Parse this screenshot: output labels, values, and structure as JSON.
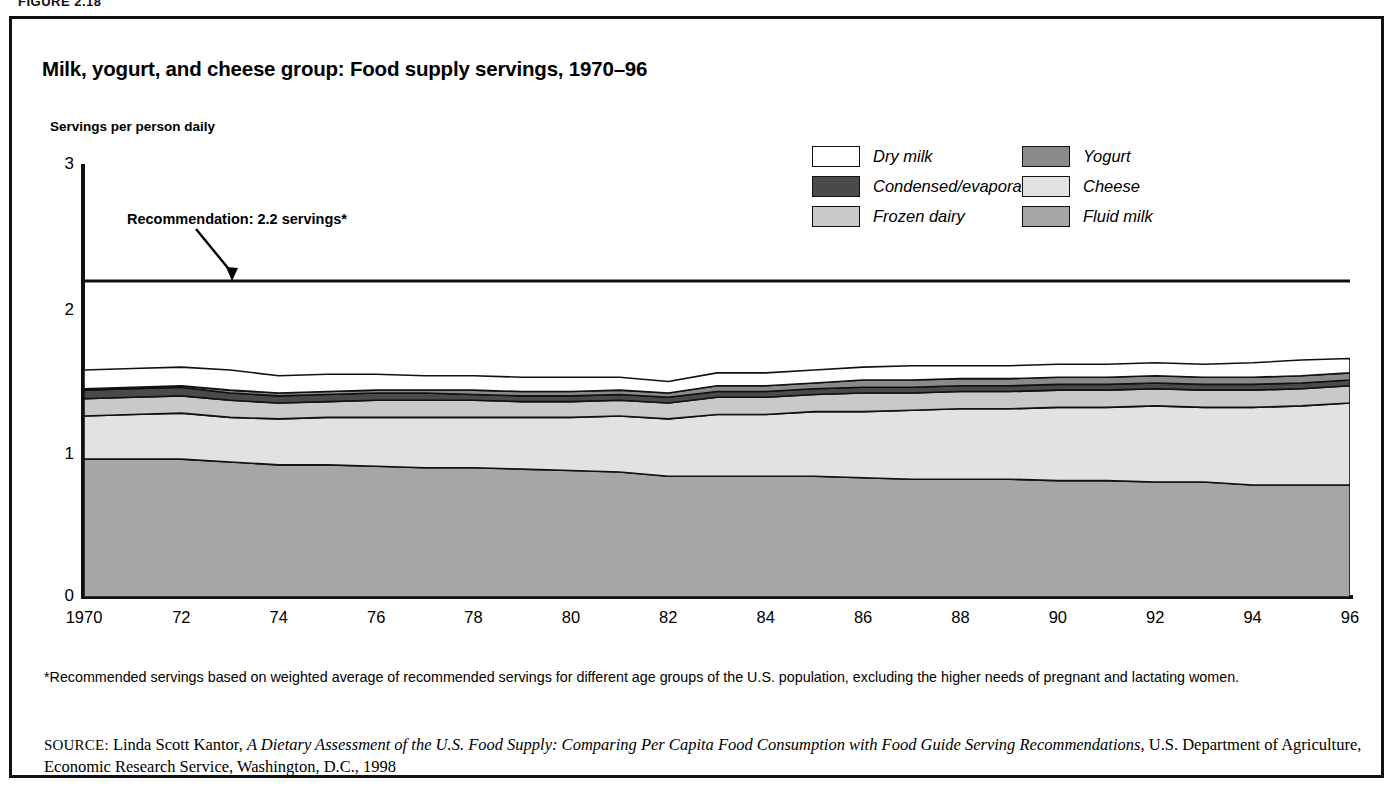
{
  "figure": {
    "label": "FIGURE 2.18"
  },
  "chart_title": "Milk, yogurt, and cheese group: Food supply servings, 1970–96",
  "y_axis_title": "Servings per person daily",
  "annotation": {
    "text": "Recommendation: 2.2 servings*",
    "value": 2.2
  },
  "legend": {
    "rows": [
      [
        {
          "label": "Dry milk",
          "color": "#ffffff"
        },
        {
          "label": "Yogurt",
          "color": "#8a8a8a"
        }
      ],
      [
        {
          "label": "Condensed/evaporated",
          "color": "#4a4a4a"
        },
        {
          "label": "Cheese",
          "color": "#e2e2e2"
        }
      ],
      [
        {
          "label": "Frozen dairy",
          "color": "#c9c9c9"
        },
        {
          "label": "Fluid milk",
          "color": "#a6a6a6"
        }
      ]
    ]
  },
  "footnote": "*Recommended servings based on weighted average of recommended servings for different age groups of the U.S. population, excluding the higher needs of pregnant and lactating women.",
  "source": {
    "prefix": "SOURCE:",
    "author": " Linda Scott Kantor, ",
    "title_italic": "A Dietary Assessment of the U.S. Food Supply: Comparing Per Capita Food Consumption with Food Guide Serving Recommendations,",
    "rest": " U.S. Department of Agriculture, Economic Research Service, Washington, D.C., 1998"
  },
  "chart_data": {
    "type": "area",
    "stacked": true,
    "title": "Milk, yogurt, and cheese group: Food supply servings, 1970–96",
    "xlabel": "",
    "ylabel": "Servings per person daily",
    "xlim": [
      1970,
      1996
    ],
    "ylim": [
      0,
      3
    ],
    "yticks": [
      0,
      1,
      2,
      3
    ],
    "ytick_labels": [
      "0",
      "1",
      "2",
      "3"
    ],
    "xticks": [
      1970,
      1972,
      1974,
      1976,
      1978,
      1980,
      1982,
      1984,
      1986,
      1988,
      1990,
      1992,
      1994,
      1996
    ],
    "xtick_labels": [
      "1970",
      "72",
      "74",
      "76",
      "78",
      "80",
      "82",
      "84",
      "86",
      "88",
      "90",
      "92",
      "94",
      "96"
    ],
    "grid": false,
    "legend_position": "top-right",
    "reference_line": {
      "label": "Recommendation: 2.2 servings*",
      "y": 2.2
    },
    "x": [
      1970,
      1971,
      1972,
      1973,
      1974,
      1975,
      1976,
      1977,
      1978,
      1979,
      1980,
      1981,
      1982,
      1983,
      1984,
      1985,
      1986,
      1987,
      1988,
      1989,
      1990,
      1991,
      1992,
      1993,
      1994,
      1995,
      1996
    ],
    "series": [
      {
        "name": "Fluid milk",
        "color": "#a6a6a6",
        "order": 1,
        "values": [
          0.96,
          0.96,
          0.96,
          0.94,
          0.92,
          0.92,
          0.91,
          0.9,
          0.9,
          0.89,
          0.88,
          0.87,
          0.84,
          0.84,
          0.84,
          0.84,
          0.83,
          0.82,
          0.82,
          0.82,
          0.81,
          0.81,
          0.8,
          0.8,
          0.78,
          0.78,
          0.78
        ]
      },
      {
        "name": "Cheese",
        "color": "#e2e2e2",
        "order": 2,
        "values": [
          0.3,
          0.31,
          0.32,
          0.31,
          0.32,
          0.33,
          0.34,
          0.35,
          0.35,
          0.36,
          0.37,
          0.39,
          0.4,
          0.43,
          0.43,
          0.45,
          0.46,
          0.48,
          0.49,
          0.49,
          0.51,
          0.51,
          0.53,
          0.52,
          0.54,
          0.55,
          0.57
        ]
      },
      {
        "name": "Frozen dairy",
        "color": "#c9c9c9",
        "order": 3,
        "values": [
          0.12,
          0.12,
          0.12,
          0.12,
          0.11,
          0.11,
          0.12,
          0.12,
          0.12,
          0.11,
          0.11,
          0.11,
          0.11,
          0.12,
          0.12,
          0.12,
          0.13,
          0.12,
          0.12,
          0.12,
          0.12,
          0.12,
          0.12,
          0.12,
          0.12,
          0.12,
          0.12
        ]
      },
      {
        "name": "Condensed/evaporated",
        "color": "#4a4a4a",
        "order": 4,
        "values": [
          0.06,
          0.06,
          0.06,
          0.05,
          0.05,
          0.05,
          0.05,
          0.05,
          0.04,
          0.04,
          0.04,
          0.04,
          0.04,
          0.04,
          0.04,
          0.04,
          0.04,
          0.04,
          0.04,
          0.04,
          0.04,
          0.04,
          0.04,
          0.04,
          0.04,
          0.04,
          0.04
        ]
      },
      {
        "name": "Yogurt",
        "color": "#8a8a8a",
        "order": 5,
        "values": [
          0.01,
          0.01,
          0.01,
          0.02,
          0.02,
          0.02,
          0.02,
          0.02,
          0.03,
          0.03,
          0.03,
          0.03,
          0.03,
          0.04,
          0.04,
          0.04,
          0.05,
          0.05,
          0.05,
          0.05,
          0.05,
          0.05,
          0.05,
          0.05,
          0.05,
          0.05,
          0.05
        ]
      },
      {
        "name": "Dry milk",
        "color": "#ffffff",
        "order": 6,
        "values": [
          0.13,
          0.13,
          0.13,
          0.14,
          0.12,
          0.12,
          0.11,
          0.1,
          0.1,
          0.1,
          0.1,
          0.09,
          0.08,
          0.09,
          0.09,
          0.09,
          0.09,
          0.1,
          0.09,
          0.09,
          0.09,
          0.09,
          0.09,
          0.09,
          0.1,
          0.11,
          0.1
        ]
      }
    ],
    "totals": [
      1.58,
      1.59,
      1.6,
      1.58,
      1.54,
      1.55,
      1.55,
      1.54,
      1.54,
      1.53,
      1.53,
      1.53,
      1.5,
      1.56,
      1.56,
      1.58,
      1.6,
      1.61,
      1.61,
      1.61,
      1.62,
      1.62,
      1.63,
      1.62,
      1.63,
      1.65,
      1.66
    ]
  }
}
